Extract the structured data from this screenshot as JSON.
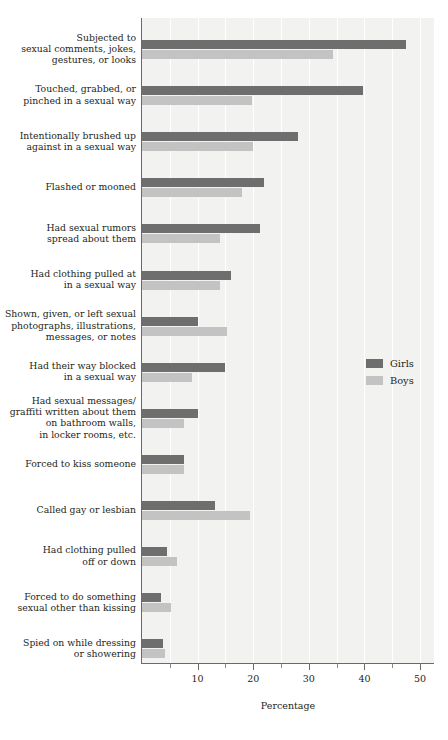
{
  "chart_data": {
    "type": "bar",
    "orientation": "horizontal",
    "title": "",
    "xlabel": "Percentage",
    "ylabel": "",
    "xlim": [
      0,
      50
    ],
    "xticks": [
      0,
      10,
      20,
      30,
      40,
      50
    ],
    "xtick_labels": [
      "",
      "10",
      "20",
      "30",
      "40",
      "50"
    ],
    "minor_ticks": [
      5,
      15,
      25,
      35,
      45
    ],
    "grid": true,
    "legend_position": "middle-right",
    "categories": [
      "Subjected to sexual comments, jokes, gestures, or looks",
      "Touched, grabbed, or pinched in a sexual way",
      "Intentionally brushed up against in a sexual way",
      "Flashed or mooned",
      "Had sexual rumors spread about them",
      "Had clothing pulled at in a sexual way",
      "Shown, given, or left sexual photographs, illustrations, messages, or notes",
      "Had their way blocked in a sexual way",
      "Had sexual messages/graffiti written about them on bathroom walls, in locker rooms, etc.",
      "Forced to kiss someone",
      "Called gay or lesbian",
      "Had clothing pulled off or down",
      "Forced to do something sexual other than kissing",
      "Spied on while dressing or showering"
    ],
    "series": [
      {
        "name": "Girls",
        "color": "#6e6e6e",
        "values": [
          47.5,
          39.8,
          28.0,
          22.0,
          21.2,
          16.0,
          10.0,
          15.0,
          10.0,
          7.6,
          13.2,
          4.5,
          3.4,
          3.8
        ]
      },
      {
        "name": "Boys",
        "color": "#c3c3c3",
        "values": [
          34.4,
          19.8,
          20.0,
          18.0,
          14.0,
          14.0,
          15.2,
          9.0,
          7.6,
          7.6,
          19.5,
          6.3,
          5.2,
          4.2
        ]
      }
    ]
  },
  "category_lines": [
    [
      "Subjected to",
      "sexual comments, jokes,",
      "gestures, or looks"
    ],
    [
      "Touched, grabbed, or",
      "pinched in a sexual way"
    ],
    [
      "Intentionally brushed up",
      "against in a sexual way"
    ],
    [
      "Flashed or mooned"
    ],
    [
      "Had sexual rumors",
      "spread about them"
    ],
    [
      "Had clothing pulled at",
      "in a sexual way"
    ],
    [
      "Shown, given, or left sexual",
      "photographs, illustrations,",
      "messages, or notes"
    ],
    [
      "Had their way blocked",
      "in a sexual way"
    ],
    [
      "Had sexual messages/",
      "graffiti written about them",
      "on bathroom walls,",
      "in locker rooms, etc."
    ],
    [
      "Forced to kiss someone"
    ],
    [
      "Called gay or lesbian"
    ],
    [
      "Had clothing pulled",
      "off or down"
    ],
    [
      "Forced to do something",
      "sexual other than kissing"
    ],
    [
      "Spied on while dressing",
      "or showering"
    ]
  ],
  "legend": {
    "entries": [
      {
        "label": "Girls",
        "color": "#6e6e6e"
      },
      {
        "label": "Boys",
        "color": "#c3c3c3"
      }
    ]
  },
  "axis": {
    "x_title": "Percentage"
  },
  "style": {
    "plot_background": "#f2f2f0",
    "gridline_color": "#ffffff",
    "axis_color": "#6a6a6a",
    "text_color": "#231f20"
  }
}
